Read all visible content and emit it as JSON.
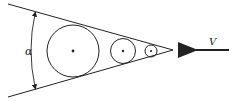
{
  "diagram": {
    "labels": {
      "angle": "α",
      "velocity": "V"
    },
    "colors": {
      "stroke": "#222222",
      "background": "#ffffff"
    },
    "cone": {
      "apex": [
        173,
        50
      ],
      "upper_start": [
        8,
        4
      ],
      "lower_start": [
        8,
        97
      ]
    },
    "circles": [
      {
        "cx": 73,
        "cy": 51,
        "r": 26
      },
      {
        "cx": 123,
        "cy": 51,
        "r": 12.5
      },
      {
        "cx": 151,
        "cy": 51,
        "r": 6
      }
    ],
    "arrow": {
      "from": [
        229,
        50
      ],
      "to": [
        187,
        50
      ]
    }
  }
}
